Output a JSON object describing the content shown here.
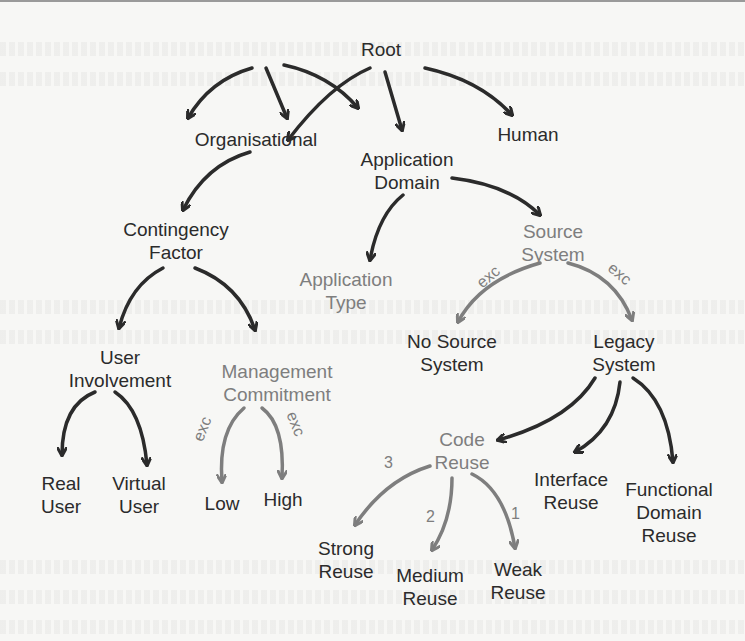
{
  "diagram": {
    "type": "taxonomy-tree",
    "colors": {
      "black_edge": "#2b2b2b",
      "grey_edge": "#7e7e7e",
      "black_text": "#2b2b2b",
      "grey_text": "#7e7e7e"
    },
    "nodes": {
      "root": {
        "line1": "Root"
      },
      "organisational": {
        "line1": "Organisational"
      },
      "application_domain": {
        "line1": "Application",
        "line2": "Domain"
      },
      "human": {
        "line1": "Human"
      },
      "contingency_factor": {
        "line1": "Contingency",
        "line2": "Factor"
      },
      "source_system": {
        "line1": "Source",
        "line2": "System"
      },
      "application_type": {
        "line1": "Application",
        "line2": "Type"
      },
      "user_involvement": {
        "line1": "User",
        "line2": "Involvement"
      },
      "management_commitment": {
        "line1": "Management",
        "line2": "Commitment"
      },
      "no_source_system": {
        "line1": "No Source",
        "line2": "System"
      },
      "legacy_system": {
        "line1": "Legacy",
        "line2": "System"
      },
      "real_user": {
        "line1": "Real",
        "line2": "User"
      },
      "virtual_user": {
        "line1": "Virtual",
        "line2": "User"
      },
      "low": {
        "line1": "Low"
      },
      "high": {
        "line1": "High"
      },
      "code_reuse": {
        "line1": "Code",
        "line2": "Reuse"
      },
      "interface_reuse": {
        "line1": "Interface",
        "line2": "Reuse"
      },
      "functional_domain_reuse": {
        "line1": "Functional",
        "line2": "Domain",
        "line3": "Reuse"
      },
      "strong_reuse": {
        "line1": "Strong",
        "line2": "Reuse"
      },
      "medium_reuse": {
        "line1": "Medium",
        "line2": "Reuse"
      },
      "weak_reuse": {
        "line1": "Weak",
        "line2": "Reuse"
      }
    },
    "edge_labels": {
      "source_no_source": "exc",
      "source_legacy": "exc",
      "mgmt_low": "exc",
      "mgmt_high": "exc",
      "code_strong": "3",
      "code_medium": "2",
      "code_weak": "1"
    },
    "edges": [
      [
        "Root",
        "Organisational"
      ],
      [
        "Root",
        "Application Domain"
      ],
      [
        "Root",
        "Human"
      ],
      [
        "Organisational",
        "Contingency Factor"
      ],
      [
        "Application Domain",
        "Application Type"
      ],
      [
        "Application Domain",
        "Source System"
      ],
      [
        "Contingency Factor",
        "User Involvement"
      ],
      [
        "Contingency Factor",
        "Management Commitment"
      ],
      [
        "Source System",
        "No Source System"
      ],
      [
        "Source System",
        "Legacy System"
      ],
      [
        "User Involvement",
        "Real User"
      ],
      [
        "User Involvement",
        "Virtual User"
      ],
      [
        "Management Commitment",
        "Low"
      ],
      [
        "Management Commitment",
        "High"
      ],
      [
        "Legacy System",
        "Code Reuse"
      ],
      [
        "Legacy System",
        "Interface Reuse"
      ],
      [
        "Legacy System",
        "Functional Domain Reuse"
      ],
      [
        "Code Reuse",
        "Strong Reuse"
      ],
      [
        "Code Reuse",
        "Medium Reuse"
      ],
      [
        "Code Reuse",
        "Weak Reuse"
      ]
    ]
  }
}
